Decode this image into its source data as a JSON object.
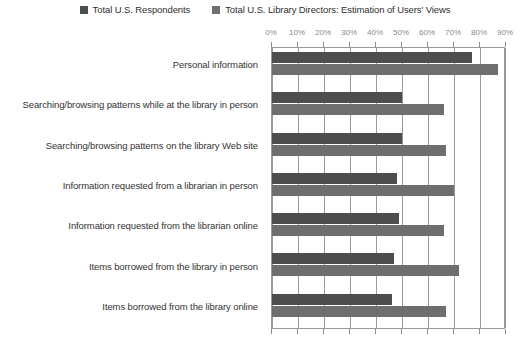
{
  "chart_data": {
    "type": "bar",
    "orientation": "horizontal",
    "title": "",
    "xlabel": "",
    "ylabel": "",
    "xlim": [
      0,
      90
    ],
    "xticks": [
      0,
      10,
      20,
      30,
      40,
      50,
      60,
      70,
      80,
      90
    ],
    "xtick_labels": [
      "0%",
      "10%",
      "20%",
      "30%",
      "40%",
      "50%",
      "60%",
      "70%",
      "80%",
      "90%"
    ],
    "grid": true,
    "legend_position": "top-center",
    "categories": [
      "Personal information",
      "Searching/browsing patterns while at the library in person",
      "Searching/browsing patterns on the library Web site",
      "Information requested from a librarian in person",
      "Information requested from the librarian online",
      "Items borrowed from the library in person",
      "Items borrowed from the library online"
    ],
    "series": [
      {
        "name": "Total U.S. Respondents",
        "color": "#4d4d4d",
        "values": [
          77,
          50,
          50,
          48,
          49,
          47,
          46
        ]
      },
      {
        "name": "Total U.S. Library Directors: Estimation of Users' Views",
        "color": "#6e6e6e",
        "values": [
          87,
          66,
          67,
          70,
          66,
          72,
          67
        ]
      }
    ]
  },
  "axis": {
    "tick_color": "#8a8a8a",
    "grid_color": "#9a9a9a"
  }
}
